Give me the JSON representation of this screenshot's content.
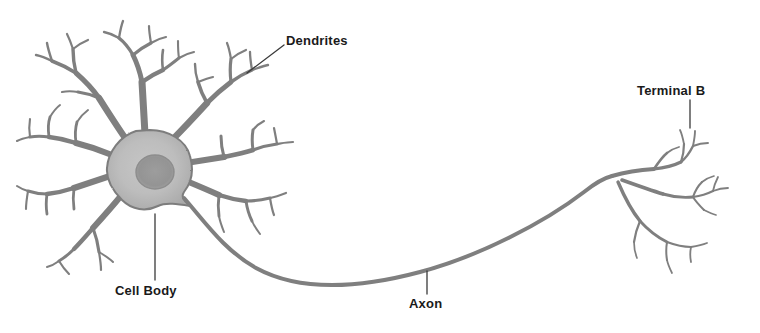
{
  "figure": {
    "width": 760,
    "height": 333,
    "background_color": "#ffffff",
    "style": "grayscale pencil illustration"
  },
  "colors": {
    "background": "#ffffff",
    "stroke_dark": "#6e6e6e",
    "stroke_mid": "#8a8a8a",
    "soma_fill": "#b9b9b9",
    "soma_edge": "#7d7d7d",
    "nucleus_fill": "#9a9a9a",
    "label_text": "#1a1a1a",
    "leader_line": "#3a3a3a"
  },
  "labels": [
    {
      "id": "dendrites",
      "text": "Dendrites",
      "clipped": false,
      "leader": {
        "type": "diagonal",
        "x1": 247,
        "y1": 73,
        "x2": 284,
        "y2": 45
      }
    },
    {
      "id": "cell-body",
      "text": "Cell Body",
      "clipped": false,
      "leader": {
        "type": "vertical",
        "x1": 155,
        "y1": 214,
        "x2": 155,
        "y2": 280
      }
    },
    {
      "id": "axon",
      "text": "Axon",
      "clipped": false,
      "leader": {
        "type": "vertical",
        "x1": 427,
        "y1": 271,
        "x2": 427,
        "y2": 294
      }
    },
    {
      "id": "terminal-buttons",
      "text": "Terminal B",
      "clipped": true,
      "leader": {
        "type": "vertical",
        "x1": 690,
        "y1": 100,
        "x2": 690,
        "y2": 128
      }
    }
  ],
  "parts": {
    "soma": {
      "name": "Cell Body",
      "center_x": 150,
      "center_y": 170,
      "radius_x": 46,
      "radius_y": 40
    },
    "nucleus": {
      "name": "Nucleus",
      "center_x": 155,
      "center_y": 172,
      "radius": 19
    },
    "dendrites": {
      "name": "Dendrites",
      "trunk_count": 8,
      "branch_levels": 4
    },
    "axon": {
      "name": "Axon",
      "start_x": 188,
      "start_y": 205,
      "lowest_y": 286,
      "end_x": 612,
      "end_y": 176
    },
    "terminal_buttons": {
      "name": "Terminal Buttons",
      "branch_count": 3,
      "origin_x": 612,
      "origin_y": 176
    }
  }
}
